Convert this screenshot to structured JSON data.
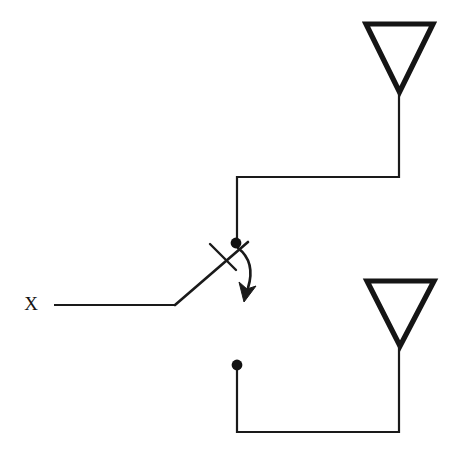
{
  "figure": {
    "kind": "schematic-diagram",
    "background_color": "#ffffff",
    "line_color": "#1a1a1a",
    "canvas": {
      "width": 449,
      "height": 456
    }
  },
  "labels": {
    "input_terminal": "X"
  },
  "components": {
    "input_lead": {
      "name": "input-lead",
      "path": "M 54 305 L 175 305"
    },
    "switch_blade": {
      "name": "switch-blade",
      "path": "M 175 305 L 248 242",
      "state": "connected-to-upper-contact"
    },
    "cross_tick": {
      "name": "switch-cross-tick",
      "path": "M 210 244 L 236 270"
    },
    "upper_contact_dot": {
      "name": "upper-contact-node",
      "cx": 236,
      "cy": 243,
      "r": 5.4
    },
    "lower_contact_dot": {
      "name": "lower-contact-node",
      "cx": 237,
      "cy": 365,
      "r": 5.4
    },
    "upper_wire": {
      "name": "upper-feed-wire",
      "path": "M 237 243 L 237 177 L 399 177 L 399 92"
    },
    "lower_wire": {
      "name": "lower-feed-wire",
      "path": "M 237 365 L 237 432 L 399 432 L 399 346"
    },
    "upper_antenna": {
      "name": "upper-antenna-triangle",
      "path": "M 366 24 L 433 24 L 399.5 92 Z"
    },
    "lower_antenna": {
      "name": "lower-antenna-triangle",
      "path": "M 367 281 L 434 281 L 400 346 Z"
    },
    "throw_arrow": {
      "name": "switch-throw-arrow",
      "curve": "M 238 248 Q 256 262 248 288",
      "head": "M 239 282 L 244 302 L 256 286 L 247 289 Z"
    }
  }
}
